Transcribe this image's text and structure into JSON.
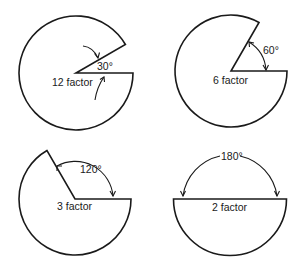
{
  "diagram": {
    "stroke_color": "#1a1a1a",
    "background": "#ffffff",
    "panels": [
      {
        "id": "twelve",
        "cut_angle_deg": 30,
        "angle_label": "30°",
        "factor_label": "12 factor"
      },
      {
        "id": "six",
        "cut_angle_deg": 60,
        "angle_label": "60°",
        "factor_label": "6 factor"
      },
      {
        "id": "three",
        "cut_angle_deg": 120,
        "angle_label": "120°",
        "factor_label": "3 factor"
      },
      {
        "id": "two",
        "cut_angle_deg": 180,
        "angle_label": "180°",
        "factor_label": "2 factor"
      }
    ]
  }
}
